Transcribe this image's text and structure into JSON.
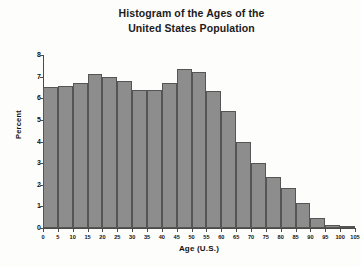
{
  "chart_data": {
    "type": "bar",
    "title": "Histogram of the Ages of the United States Population",
    "title_lines": [
      "Histogram of the Ages of the",
      "United States Population"
    ],
    "xlabel": "Age (U.S.)",
    "ylabel": "Percent",
    "xlim": [
      0,
      105
    ],
    "ylim": [
      0,
      8
    ],
    "grid": false,
    "legend": false,
    "bin_width": 5,
    "bar_color": "#8d8d8d",
    "bar_edge_color": "#555555",
    "xticks": [
      0,
      5,
      10,
      15,
      20,
      25,
      30,
      35,
      40,
      45,
      50,
      55,
      60,
      65,
      70,
      75,
      80,
      85,
      90,
      95,
      100,
      105
    ],
    "yticks": [
      0,
      1,
      2,
      3,
      4,
      5,
      6,
      7,
      8
    ],
    "categories": [
      "0-5",
      "5-10",
      "10-15",
      "15-20",
      "20-25",
      "25-30",
      "30-35",
      "35-40",
      "40-45",
      "45-50",
      "50-55",
      "55-60",
      "60-65",
      "65-70",
      "70-75",
      "75-80",
      "80-85",
      "85-90",
      "90-95",
      "95-100",
      "100-105"
    ],
    "bin_starts": [
      0,
      5,
      10,
      15,
      20,
      25,
      30,
      35,
      40,
      45,
      50,
      55,
      60,
      65,
      70,
      75,
      80,
      85,
      90,
      95,
      100
    ],
    "values": [
      6.5,
      6.55,
      6.7,
      7.1,
      7.0,
      6.8,
      6.4,
      6.4,
      6.7,
      7.35,
      7.2,
      6.35,
      5.4,
      4.0,
      3.0,
      2.35,
      1.85,
      1.15,
      0.45,
      0.12,
      0.02
    ]
  }
}
